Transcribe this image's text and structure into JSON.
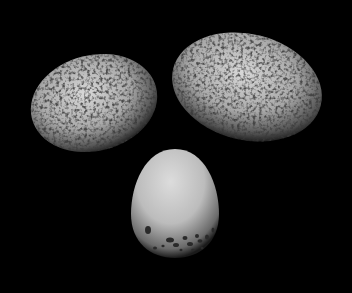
{
  "image": {
    "description": "Three bird eggs photographed on a black background: two heavily speckled eggs on top, one pale egg with dark spots at its base below",
    "background_color": "#000000",
    "eggs": [
      {
        "label": "speckled egg left",
        "cx": 94,
        "cy": 103,
        "rx": 64,
        "ry": 48,
        "rotate": -14
      },
      {
        "label": "speckled egg right",
        "cx": 247,
        "cy": 87,
        "rx": 76,
        "ry": 53,
        "rotate": 14
      },
      {
        "label": "pale spotted egg",
        "cx": 175,
        "cy": 203,
        "rx": 44,
        "ry": 55,
        "rotate": 0
      }
    ]
  }
}
